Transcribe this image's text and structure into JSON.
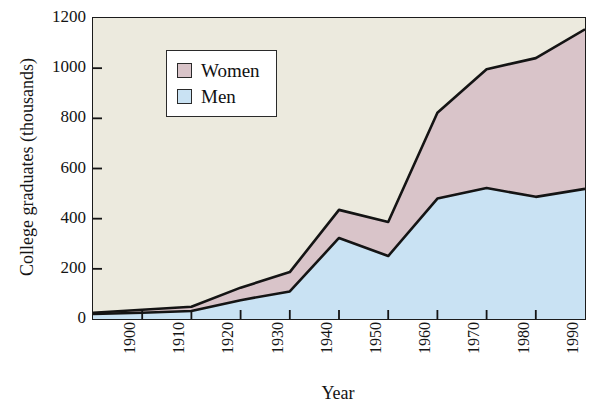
{
  "chart_data": {
    "type": "area",
    "stacked": true,
    "title": "",
    "xlabel": "Year",
    "ylabel": "College graduates (thousands)",
    "x": [
      1900,
      1910,
      1920,
      1930,
      1940,
      1950,
      1960,
      1970,
      1980,
      1990,
      2000
    ],
    "categories": [
      "1900",
      "1910",
      "1920",
      "1930",
      "1940",
      "1950",
      "1960",
      "1970",
      "1980",
      "1990",
      "2000"
    ],
    "xlim": [
      1900,
      2000
    ],
    "ylim": [
      0,
      1200
    ],
    "yticks": [
      0,
      200,
      400,
      600,
      800,
      1000,
      1200
    ],
    "ytick_labels": [
      "0",
      "200",
      "400",
      "600",
      "800",
      "1000",
      "1200"
    ],
    "grid": false,
    "legend_position": "upper left",
    "series": [
      {
        "name": "Men",
        "color": "#c9e2f3",
        "values": [
          20,
          25,
          32,
          75,
          110,
          323,
          251,
          480,
          522,
          487,
          519
        ]
      },
      {
        "name": "Women",
        "color": "#d9c4c9",
        "values": [
          5,
          12,
          17,
          50,
          77,
          112,
          136,
          342,
          474,
          553,
          636
        ]
      }
    ],
    "totals": [
      25,
      37,
      49,
      125,
      187,
      435,
      387,
      822,
      996,
      1040,
      1155
    ],
    "line_color": "#141414",
    "plot_background": "#eceade",
    "page_background": "#ffffff"
  },
  "legend": {
    "items": [
      {
        "label": "Women",
        "swatch_color": "#d9c4c9"
      },
      {
        "label": "Men",
        "swatch_color": "#c9e2f3"
      }
    ]
  },
  "axes": {
    "y_title": "College graduates (thousands)",
    "x_title": "Year"
  }
}
